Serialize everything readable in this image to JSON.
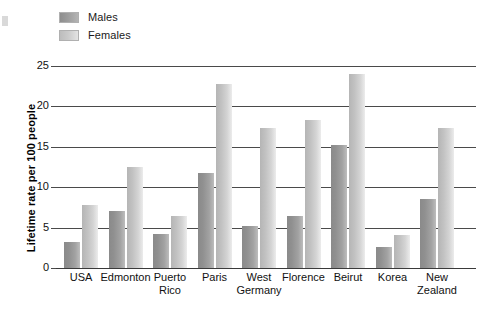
{
  "chart_data": {
    "type": "bar",
    "title": "",
    "xlabel": "",
    "ylabel": "Lifetime rate per 100 people",
    "ylim": [
      0,
      25
    ],
    "yticks": [
      "0",
      "5",
      "10",
      "15",
      "20",
      "25"
    ],
    "grid": true,
    "legend_position": "top-left",
    "categories": [
      "USA",
      "Edmonton",
      "Puerto Rico",
      "Paris",
      "West Germany",
      "Florence",
      "Beirut",
      "Korea",
      "New Zealand"
    ],
    "category_lines": [
      [
        "USA",
        ""
      ],
      [
        "Edmonton",
        ""
      ],
      [
        "Puerto",
        "Rico"
      ],
      [
        "Paris",
        ""
      ],
      [
        "West",
        "Germany"
      ],
      [
        "Florence",
        ""
      ],
      [
        "Beirut",
        ""
      ],
      [
        "Korea",
        ""
      ],
      [
        "New",
        "Zealand"
      ]
    ],
    "series": [
      {
        "name": "Males",
        "color": "#9a9a9a",
        "values": [
          3.2,
          7.0,
          4.2,
          11.7,
          5.2,
          6.4,
          15.2,
          2.6,
          8.6
        ]
      },
      {
        "name": "Females",
        "color": "#cfcfcf",
        "values": [
          7.8,
          12.5,
          6.4,
          22.8,
          17.3,
          18.3,
          24.0,
          4.1,
          17.3
        ]
      }
    ]
  },
  "legend": {
    "items": [
      {
        "label": "Males"
      },
      {
        "label": "Females"
      }
    ]
  },
  "axis": {
    "y_title": "Lifetime rate per 100 people"
  }
}
